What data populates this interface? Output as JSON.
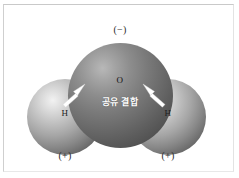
{
  "figure": {
    "background_color": "#ffffff",
    "frame_color": "#c9c9c9"
  },
  "molecule": {
    "name": "water",
    "atoms": [
      {
        "id": "oxygen",
        "symbol": "O",
        "role": "central-atom",
        "color": "#6a6a6a",
        "charge_label": "(−)"
      },
      {
        "id": "hydrogen-left",
        "symbol": "H",
        "role": "terminal-atom",
        "color": "#a5a5a5",
        "charge_label": "(+)"
      },
      {
        "id": "hydrogen-right",
        "symbol": "H",
        "role": "terminal-atom",
        "color": "#a5a5a5",
        "charge_label": "(+)"
      }
    ],
    "bond_caption": "공유 결합",
    "arrows": [
      {
        "id": "arrow-left",
        "points_to": "oxygen-hydrogen-left-bond",
        "color": "#ffffff"
      },
      {
        "id": "arrow-right",
        "points_to": "oxygen-hydrogen-right-bond",
        "color": "#ffffff"
      }
    ]
  },
  "labels": {
    "oxygen_symbol": "O",
    "hydrogen_left_symbol": "H",
    "hydrogen_right_symbol": "H",
    "negative_charge": "(−)",
    "positive_charge_left": "(+)",
    "positive_charge_right": "(+)",
    "bond_text": "공유 결합"
  }
}
